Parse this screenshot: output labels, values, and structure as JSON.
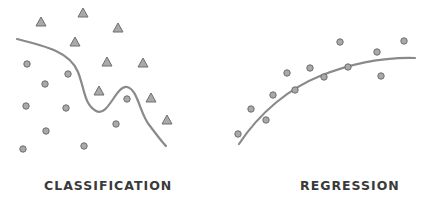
{
  "panels": [
    {
      "title": "CLASSIFICATION",
      "triangles": [
        [
          41,
          22
        ],
        [
          83,
          13
        ],
        [
          118,
          28
        ],
        [
          75,
          42
        ],
        [
          107,
          62
        ],
        [
          143,
          63
        ],
        [
          99,
          91
        ],
        [
          151,
          98
        ],
        [
          167,
          120
        ]
      ],
      "circles": [
        [
          27,
          64
        ],
        [
          45,
          84
        ],
        [
          68,
          74
        ],
        [
          26,
          106
        ],
        [
          66,
          108
        ],
        [
          127,
          99
        ],
        [
          46,
          131
        ],
        [
          116,
          124
        ],
        [
          23,
          149
        ],
        [
          84,
          146
        ]
      ],
      "boundary": "M17,39 C45,46 70,52 78,72 C85,90 84,104 96,111 C108,118 116,85 127,87 C138,89 140,115 150,126 C156,134 162,142 166,146"
    },
    {
      "title": "REGRESSION",
      "circles": [
        [
          238,
          134
        ],
        [
          251,
          109
        ],
        [
          266,
          120
        ],
        [
          273,
          95
        ],
        [
          287,
          73
        ],
        [
          295,
          90
        ],
        [
          310,
          68
        ],
        [
          324,
          77
        ],
        [
          340,
          42
        ],
        [
          348,
          67
        ],
        [
          377,
          52
        ],
        [
          381,
          76
        ],
        [
          404,
          41
        ]
      ],
      "fit_curve": "M239,144 C260,112 290,88 320,76 C350,64 380,57 415,58"
    }
  ],
  "colors": {
    "marker_fill": "#a9a9a9",
    "marker_stroke": "#6e6e6e",
    "curve": "#8a8a8a",
    "label": "#3a3a3a"
  }
}
